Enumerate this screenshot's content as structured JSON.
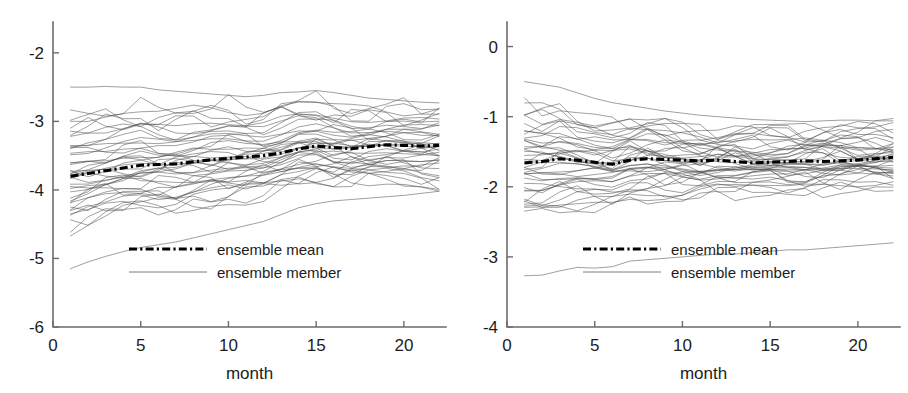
{
  "figure": {
    "panel_count": 2,
    "background_color": "#ffffff",
    "line_color_member": "#4a4a4a",
    "line_color_mean": "#000000"
  },
  "chart_data": [
    {
      "type": "line",
      "panel": "left",
      "title": "",
      "xlabel": "month",
      "ylabel": "",
      "xlim": [
        0,
        22.4
      ],
      "ylim": [
        -6,
        -1.55
      ],
      "xticks": [
        0,
        5,
        10,
        15,
        20
      ],
      "xtick_labels": [
        "0",
        "5",
        "10",
        "15",
        "20"
      ],
      "yticks": [
        -2,
        -3,
        -4,
        -5,
        -6
      ],
      "ytick_labels": [
        "-2",
        "-3",
        "-4",
        "-5",
        "-6"
      ],
      "grid": false,
      "legend_position": "lower center",
      "legend": [
        {
          "label": "ensemble mean",
          "style": "dash-dot",
          "width": "thick",
          "color": "#000000"
        },
        {
          "label": "ensemble member",
          "style": "solid",
          "width": "thin",
          "color": "#6e6e6e"
        }
      ],
      "x": [
        1,
        2,
        3,
        4,
        5,
        6,
        7,
        8,
        9,
        10,
        11,
        12,
        13,
        14,
        15,
        16,
        17,
        18,
        19,
        20,
        21,
        22
      ],
      "series": [
        {
          "name": "ensemble mean",
          "role": "mean",
          "values": [
            -3.8,
            -3.76,
            -3.72,
            -3.68,
            -3.64,
            -3.63,
            -3.62,
            -3.59,
            -3.56,
            -3.54,
            -3.52,
            -3.5,
            -3.46,
            -3.4,
            -3.36,
            -3.38,
            -3.4,
            -3.37,
            -3.34,
            -3.35,
            -3.36,
            -3.35
          ]
        },
        {
          "name": "ensemble member upper extreme",
          "role": "member",
          "values": [
            -2.5,
            -2.5,
            -2.49,
            -2.5,
            -2.5,
            -2.54,
            -2.56,
            -2.58,
            -2.6,
            -2.62,
            -2.64,
            -2.62,
            -2.58,
            -2.57,
            -2.55,
            -2.58,
            -2.62,
            -2.66,
            -2.68,
            -2.7,
            -2.72,
            -2.73
          ]
        },
        {
          "name": "ensemble member lower extreme",
          "role": "member",
          "values": [
            -5.15,
            -5.05,
            -4.97,
            -4.9,
            -4.84,
            -4.8,
            -4.76,
            -4.7,
            -4.64,
            -4.58,
            -4.52,
            -4.46,
            -4.36,
            -4.26,
            -4.2,
            -4.16,
            -4.14,
            -4.12,
            -4.1,
            -4.08,
            -4.05,
            -4.02
          ]
        }
      ],
      "band_upper": [
        -2.85,
        -2.84,
        -2.82,
        -2.8,
        -2.78,
        -2.8,
        -2.82,
        -2.8,
        -2.78,
        -2.76,
        -2.78,
        -2.8,
        -2.74,
        -2.7,
        -2.72,
        -2.78,
        -2.82,
        -2.8,
        -2.8,
        -2.82,
        -2.84,
        -2.84
      ],
      "band_lower": [
        -4.55,
        -4.48,
        -4.42,
        -4.37,
        -4.32,
        -4.3,
        -4.35,
        -4.3,
        -4.24,
        -4.18,
        -4.14,
        -4.1,
        -4.02,
        -3.96,
        -3.9,
        -3.92,
        -3.94,
        -3.92,
        -3.9,
        -3.92,
        -3.94,
        -3.98
      ],
      "member_count": 40,
      "notes": "Ensemble spaghetti; spread narrows and mean drifts upward from about -3.8 to -3.35"
    },
    {
      "type": "line",
      "panel": "right",
      "title": "",
      "xlabel": "month",
      "ylabel": "",
      "xlim": [
        0,
        22.4
      ],
      "ylim": [
        -4,
        0.35
      ],
      "xticks": [
        0,
        5,
        10,
        15,
        20
      ],
      "xtick_labels": [
        "0",
        "5",
        "10",
        "15",
        "20"
      ],
      "yticks": [
        0,
        -1,
        -2,
        -3,
        -4
      ],
      "ytick_labels": [
        "0",
        "-1",
        "-2",
        "-3",
        "-4"
      ],
      "grid": false,
      "legend_position": "lower center",
      "legend": [
        {
          "label": "ensemble mean",
          "style": "dash-dot",
          "width": "thick",
          "color": "#000000"
        },
        {
          "label": "ensemble member",
          "style": "solid",
          "width": "thin",
          "color": "#6e6e6e"
        }
      ],
      "x": [
        1,
        2,
        3,
        4,
        5,
        6,
        7,
        8,
        9,
        10,
        11,
        12,
        13,
        14,
        15,
        16,
        17,
        18,
        19,
        20,
        21,
        22
      ],
      "series": [
        {
          "name": "ensemble mean",
          "role": "mean",
          "values": [
            -1.66,
            -1.64,
            -1.6,
            -1.62,
            -1.65,
            -1.68,
            -1.62,
            -1.6,
            -1.61,
            -1.62,
            -1.63,
            -1.62,
            -1.64,
            -1.66,
            -1.65,
            -1.64,
            -1.63,
            -1.64,
            -1.63,
            -1.62,
            -1.6,
            -1.58
          ]
        },
        {
          "name": "ensemble member upper extreme",
          "role": "member",
          "values": [
            -0.5,
            -0.54,
            -0.58,
            -0.66,
            -0.74,
            -0.8,
            -0.84,
            -0.88,
            -0.92,
            -0.95,
            -0.98,
            -1.0,
            -1.02,
            -1.04,
            -1.05,
            -1.06,
            -1.07,
            -1.06,
            -1.05,
            -1.05,
            -1.06,
            -1.06
          ]
        },
        {
          "name": "ensemble member lower extreme",
          "role": "member",
          "values": [
            -3.27,
            -3.26,
            -3.2,
            -3.15,
            -3.16,
            -3.14,
            -3.06,
            -3.04,
            -3.02,
            -3.0,
            -2.98,
            -2.96,
            -2.96,
            -2.94,
            -2.92,
            -2.9,
            -2.9,
            -2.88,
            -2.86,
            -2.84,
            -2.82,
            -2.8
          ]
        }
      ],
      "band_upper": [
        -0.8,
        -0.86,
        -0.84,
        -0.92,
        -1.0,
        -1.06,
        -1.04,
        -1.06,
        -1.1,
        -1.12,
        -1.14,
        -1.16,
        -1.18,
        -1.18,
        -1.16,
        -1.16,
        -1.17,
        -1.16,
        -1.15,
        -1.14,
        -1.14,
        -1.14
      ],
      "band_lower": [
        -2.42,
        -2.4,
        -2.36,
        -2.34,
        -2.32,
        -2.3,
        -2.22,
        -2.2,
        -2.18,
        -2.16,
        -2.14,
        -2.12,
        -2.12,
        -2.1,
        -2.08,
        -2.08,
        -2.06,
        -2.05,
        -2.04,
        -2.03,
        -2.02,
        -2.02
      ],
      "member_count": 40,
      "notes": "Ensemble spaghetti; spread narrows toward month 22, mean nearly flat near -1.62"
    }
  ]
}
